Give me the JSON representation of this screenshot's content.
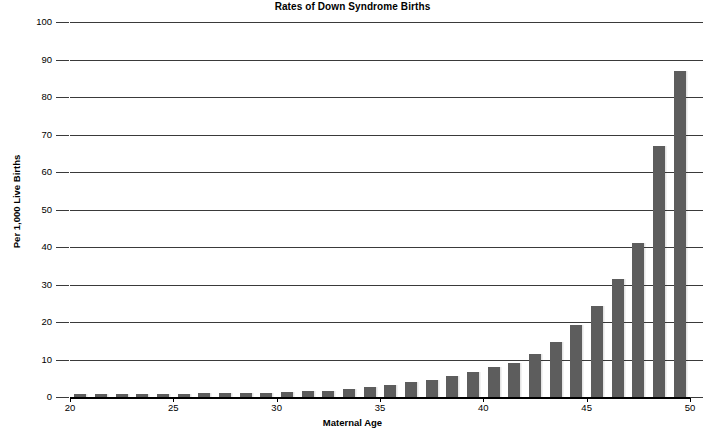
{
  "chart_data": {
    "type": "bar",
    "title": "Rates of Down Syndrome Births",
    "xlabel": "Maternal Age",
    "ylabel": "Per 1,000 Live Births",
    "xlim": [
      20,
      50
    ],
    "ylim": [
      0,
      100
    ],
    "grid": true,
    "legend": null,
    "bar_color": "#5d5d5d",
    "axis_color": "#000000",
    "gridline_color": "#3a3a3a",
    "ytick_labels": [
      "100",
      "90",
      "80",
      "70",
      "60",
      "50",
      "40",
      "30",
      "20",
      "10",
      "0"
    ],
    "ytick_values": [
      100,
      90,
      80,
      70,
      60,
      50,
      40,
      30,
      20,
      10,
      0
    ],
    "xtick_labels": [
      "20",
      "25",
      "30",
      "35",
      "40",
      "45",
      "50"
    ],
    "xtick_values": [
      20,
      25,
      30,
      35,
      40,
      45,
      50
    ],
    "categories": [
      20,
      21,
      22,
      23,
      24,
      25,
      26,
      27,
      28,
      29,
      30,
      31,
      32,
      33,
      34,
      35,
      36,
      37,
      38,
      39,
      40,
      41,
      42,
      43,
      44,
      45,
      46,
      47,
      48,
      49
    ],
    "values": [
      0.7,
      0.7,
      0.8,
      0.8,
      0.8,
      0.9,
      1.0,
      1.0,
      1.1,
      1.2,
      1.3,
      1.5,
      1.7,
      2.2,
      2.6,
      3.2,
      3.9,
      4.6,
      5.6,
      6.7,
      7.9,
      9.1,
      11.4,
      14.6,
      19.3,
      24.2,
      31.4,
      41.0,
      51.6,
      86.9
    ],
    "series": [
      {
        "name": "Rate per 1,000 live births",
        "values": [
          0.7,
          0.7,
          0.8,
          0.8,
          0.8,
          0.9,
          1.0,
          1.0,
          1.1,
          1.2,
          1.3,
          1.5,
          1.7,
          2.2,
          2.6,
          3.2,
          3.9,
          4.6,
          5.6,
          6.7,
          7.9,
          9.1,
          11.4,
          14.6,
          19.3,
          24.2,
          31.4,
          41.0,
          51.6,
          86.9
        ]
      }
    ]
  },
  "chart_override_values": [
    0.7,
    0.7,
    0.8,
    0.8,
    0.8,
    0.9,
    1.0,
    1.0,
    1.1,
    1.2,
    1.3,
    1.5,
    1.7,
    2.2,
    2.6,
    3.2,
    3.9,
    4.6,
    5.6,
    6.7,
    7.9,
    9.1,
    11.4,
    14.6,
    19.3,
    24.2,
    31.4,
    41.0,
    51.6,
    67.0,
    86.9
  ]
}
